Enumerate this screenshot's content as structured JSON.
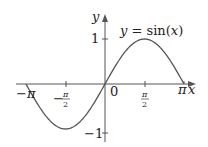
{
  "chart_data": {
    "type": "line",
    "title": "",
    "annotation": "y = sin(x)",
    "xlabel": "x",
    "ylabel": "y",
    "xlim": [
      -3.14159,
      3.14159
    ],
    "ylim": [
      -1,
      1
    ],
    "grid": false,
    "legend": null,
    "x_ticks": [
      {
        "value": -3.14159,
        "label": "−π"
      },
      {
        "value": -1.5708,
        "label": "−π/2"
      },
      {
        "value": 0,
        "label": "0"
      },
      {
        "value": 1.5708,
        "label": "π/2"
      },
      {
        "value": 3.14159,
        "label": "π"
      }
    ],
    "y_ticks": [
      {
        "value": 1,
        "label": "1"
      },
      {
        "value": -1,
        "label": "−1"
      }
    ],
    "series": [
      {
        "name": "sin(x)",
        "x": [
          -3.14159,
          -2.35619,
          -1.5708,
          -0.7854,
          0,
          0.7854,
          1.5708,
          2.35619,
          3.14159
        ],
        "values": [
          0,
          -0.7071,
          -1,
          -0.7071,
          0,
          0.7071,
          1,
          0.7071,
          0
        ],
        "color": "#555555"
      }
    ]
  },
  "labels": {
    "func_y": "y",
    "func_eq": " = sin(",
    "func_x": "x",
    "func_close": ")",
    "axis_x": "x",
    "axis_y": "y",
    "tick_zero": "0",
    "tick_one": "1",
    "tick_neg_one": "−1",
    "tick_pi": "π",
    "tick_neg_pi": "−π",
    "frac_pi": "π",
    "frac_two": "2",
    "minus": "−"
  }
}
